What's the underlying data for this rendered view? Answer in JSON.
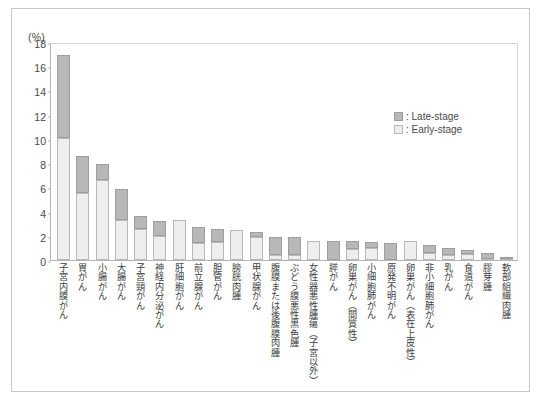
{
  "chart_data": {
    "type": "bar",
    "title": "",
    "xlabel": "",
    "ylabel": "(%)",
    "ylim": [
      0,
      18
    ],
    "yticks": [
      0,
      2,
      4,
      6,
      8,
      10,
      12,
      14,
      16,
      18
    ],
    "grid": false,
    "stacked": true,
    "legend_position": "top-right",
    "categories": [
      "子宮内膜がん",
      "胃がん",
      "小腸がん",
      "大腸がん",
      "子宮頸がん",
      "神経内分泌がん",
      "肝細胞がん",
      "前立腺がん",
      "胆管がん",
      "膀胱肉腫",
      "甲状腺がん",
      "腹膜または後腹膜肉腫",
      "ぶどう膜悪性黒色腫",
      "女性器悪性腫瘍（子宮以外）",
      "膵がん",
      "卵巣がん（間質性）",
      "小細胞肺がん",
      "原発不明がん",
      "卵巣がん（表在上皮性）",
      "非小細胞肺がん",
      "乳がん",
      "食道がん",
      "膠芽腫",
      "軟部組織肉腫"
    ],
    "series": [
      {
        "name": "Early-stage",
        "color": "#eeeeee",
        "values": [
          10.1,
          5.5,
          6.6,
          3.3,
          2.6,
          2.0,
          3.3,
          1.4,
          1.5,
          2.5,
          1.9,
          0.4,
          0.4,
          1.6,
          0.0,
          0.9,
          1.0,
          0.0,
          1.6,
          0.6,
          0.4,
          0.5,
          0.1,
          0.1
        ]
      },
      {
        "name": "Late-stage",
        "color": "#b8b8b8",
        "values": [
          6.8,
          3.1,
          1.3,
          2.6,
          1.0,
          1.2,
          0.0,
          1.3,
          1.1,
          0.0,
          0.4,
          1.5,
          1.5,
          0.0,
          1.6,
          0.7,
          0.5,
          1.4,
          0.0,
          0.6,
          0.6,
          0.3,
          0.5,
          0.1
        ]
      }
    ],
    "totals": [
      16.9,
      8.6,
      7.9,
      5.9,
      3.6,
      3.2,
      3.3,
      2.7,
      2.6,
      2.5,
      2.3,
      1.9,
      1.9,
      1.6,
      1.6,
      1.6,
      1.5,
      1.4,
      1.6,
      1.2,
      1.0,
      0.8,
      0.6,
      0.2
    ]
  },
  "axis": {
    "unit_label": "(%)"
  },
  "legend": {
    "items": [
      {
        "label": ": Late-stage",
        "swatch": "late-stage-swatch"
      },
      {
        "label": ": Early-stage",
        "swatch": "early-stage-swatch"
      }
    ]
  },
  "caption": {
    "tag": "",
    "text": ""
  }
}
